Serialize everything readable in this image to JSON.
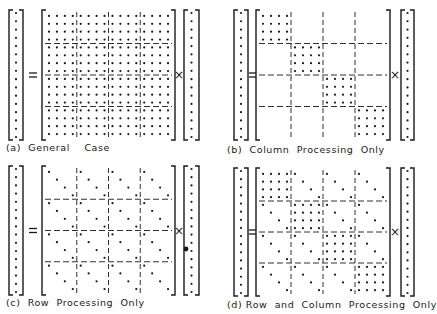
{
  "panels": [
    {
      "id": "a",
      "caption": "(a)  General    Case",
      "pattern": "general"
    },
    {
      "id": "b",
      "caption": "(b)  Column  Processing  Only",
      "pattern": "column"
    },
    {
      "id": "c",
      "caption": "(c)  Row  Processing  Only",
      "pattern": "row"
    },
    {
      "id": "d",
      "caption": "(d) Row  and  Column  Processing  Only",
      "pattern": "rowcol"
    }
  ],
  "symbols": {
    "equals": "=",
    "times": "×"
  },
  "grid": {
    "blocks": 4,
    "block_size": 4,
    "vector_length": 16
  },
  "colors": {
    "ink": "#1a1a1a",
    "background": "#ffffff"
  }
}
